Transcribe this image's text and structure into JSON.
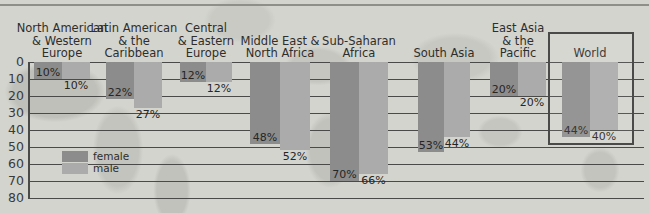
{
  "chart_data": {
    "type": "bar",
    "title": "",
    "subtitle": "",
    "xlabel": "",
    "ylabel": "",
    "ylim": [
      0,
      80
    ],
    "yticks": [
      0,
      10,
      20,
      30,
      40,
      50,
      60,
      70,
      80
    ],
    "grid": true,
    "orientation": "vertical-downward",
    "legend_position": "inside-left",
    "categories": [
      "North American\n& Western\nEurope",
      "Latin American\n& the\nCaribbean",
      "Central\n& Eastern\nEurope",
      "Middle East &\nNorth Africa",
      "Sub-Saharan\nAfrica",
      "South Asia",
      "East Asia\n& the\nPacific",
      "World"
    ],
    "series": [
      {
        "name": "female",
        "color": "#8c8c8c",
        "values": [
          10,
          22,
          12,
          48,
          70,
          53,
          20,
          44
        ],
        "labels": [
          "10%",
          "22%",
          "12%",
          "48%",
          "70%",
          "53%",
          "20%",
          "44%"
        ]
      },
      {
        "name": "male",
        "color": "#ababab",
        "values": [
          10,
          27,
          12,
          52,
          66,
          44,
          20,
          40
        ],
        "labels": [
          "10%",
          "27%",
          "12%",
          "52%",
          "66%",
          "44%",
          "20%",
          "40%"
        ]
      }
    ],
    "highlighted_category": "World",
    "background": "#d4d4cf",
    "axis_color": "#4a4a48"
  },
  "legend": {
    "items": [
      {
        "label": "female",
        "color": "#8c8c8c"
      },
      {
        "label": "male",
        "color": "#ababab"
      }
    ]
  }
}
